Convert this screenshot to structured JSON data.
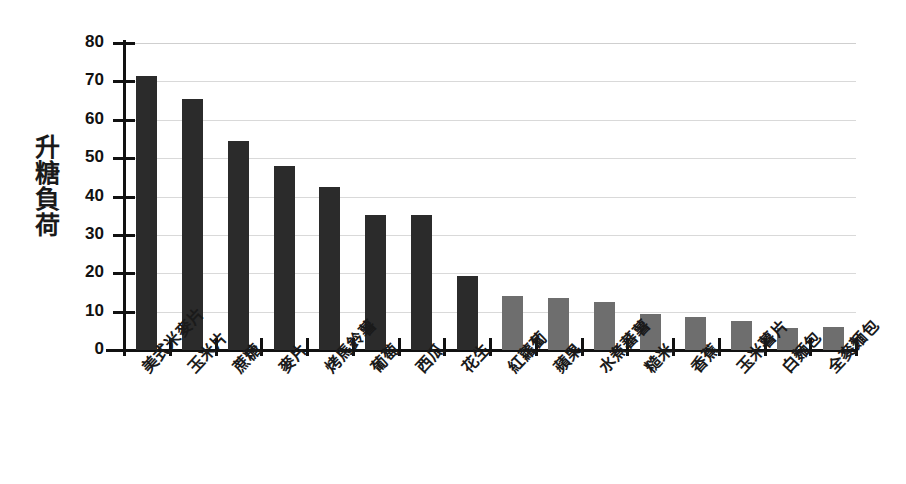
{
  "chart_data": {
    "type": "bar",
    "title": "",
    "xlabel": "",
    "ylabel": "升糖負荷",
    "ylim": [
      0,
      80
    ],
    "ytick_values": [
      0,
      10,
      20,
      30,
      40,
      50,
      60,
      70,
      80
    ],
    "ytick_labels": [
      "0",
      "10",
      "20",
      "30",
      "40",
      "50",
      "60",
      "70",
      "80"
    ],
    "grid": "horizontal",
    "legend": "none",
    "categories": [
      "美式米麥片",
      "玉米片",
      "蔗糖",
      "麥片",
      "烤馬鈴薯",
      "葡萄",
      "西瓜",
      "花生",
      "紅蘿蔔",
      "蘋果",
      "水煮蕃薯",
      "糙米",
      "香蕉",
      "玉米薯片",
      "白麵包",
      "全麥麵包"
    ],
    "values": [
      71.5,
      65.5,
      54.5,
      48,
      42.5,
      35.2,
      35.2,
      19.2,
      14.2,
      13.5,
      12.6,
      9.4,
      8.7,
      7.5,
      5.8,
      5.9
    ],
    "bar_colors": [
      "#2b2b2b",
      "#2b2b2b",
      "#2b2b2b",
      "#2b2b2b",
      "#2b2b2b",
      "#2b2b2b",
      "#2b2b2b",
      "#2b2b2b",
      "#6e6e6e",
      "#6e6e6e",
      "#6e6e6e",
      "#6e6e6e",
      "#6e6e6e",
      "#6e6e6e",
      "#6e6e6e",
      "#6e6e6e"
    ],
    "colors": {
      "high_group": "#2b2b2b",
      "low_group": "#6e6e6e",
      "axis": "#111111",
      "gridline": "#d9d9d9",
      "background": "#ffffff"
    }
  }
}
